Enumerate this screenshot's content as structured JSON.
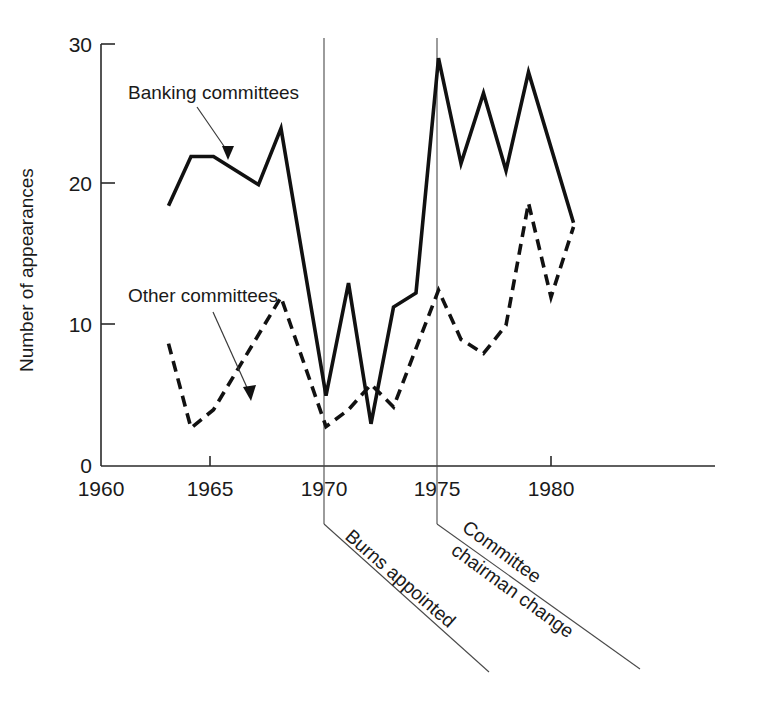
{
  "chart_data": {
    "type": "line",
    "title": "",
    "xlabel": "",
    "ylabel": "Number of appearances",
    "xlim": [
      1960,
      1982
    ],
    "ylim": [
      0,
      30
    ],
    "xticks": [
      1960,
      1965,
      1970,
      1975,
      1980
    ],
    "xticklabels": [
      "1960",
      "1965",
      "1970",
      "1975",
      "1980"
    ],
    "yticks": [
      0,
      10,
      20,
      30
    ],
    "yticklabels": [
      "0",
      "10",
      "20",
      "30"
    ],
    "grid": false,
    "legend_position": "inline-annotations",
    "series": [
      {
        "name": "Banking committees",
        "style": "solid",
        "color": "#111111",
        "x": [
          1963,
          1964,
          1965,
          1967,
          1968,
          1970,
          1971,
          1972,
          1973,
          1974,
          1975,
          1976,
          1977,
          1978,
          1979,
          1981
        ],
        "values": [
          18.5,
          22.0,
          22.0,
          20.0,
          24.0,
          5.0,
          13.0,
          3.0,
          11.3,
          12.3,
          29.0,
          21.5,
          26.5,
          21.0,
          28.0,
          17.3
        ]
      },
      {
        "name": "Other committees",
        "style": "dashed",
        "color": "#111111",
        "x": [
          1963,
          1964,
          1965,
          1968,
          1970,
          1971,
          1972,
          1973,
          1975,
          1976,
          1977,
          1978,
          1979,
          1980,
          1981
        ],
        "values": [
          8.7,
          2.7,
          4.0,
          12.0,
          2.8,
          4.0,
          5.8,
          4.2,
          12.5,
          9.0,
          8.0,
          10.0,
          18.7,
          12.0,
          17.0
        ]
      }
    ],
    "annotations": [
      {
        "name": "burns-appointed",
        "text": "Burns appointed",
        "marker_x": 1970,
        "marker_type": "vertical-line",
        "leader": "diagonal-down-right"
      },
      {
        "name": "committee-chairman-change",
        "text_line1": "Committee",
        "text_line2": "chairman change",
        "marker_x": 1975,
        "marker_type": "vertical-line",
        "leader": "diagonal-down-right"
      }
    ],
    "series_callouts": [
      {
        "name": "banking-committees-callout",
        "text": "Banking committees"
      },
      {
        "name": "other-committees-callout",
        "text": "Other committees"
      }
    ]
  }
}
